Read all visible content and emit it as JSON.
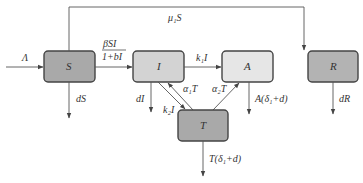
{
  "diagram": {
    "type": "compartmental-model-flowchart",
    "nodes": [
      {
        "id": "S",
        "label": "S",
        "fill": "#a9a9a9"
      },
      {
        "id": "I",
        "label": "I",
        "fill": "#d3d3d3"
      },
      {
        "id": "A",
        "label": "A",
        "fill": "#e6e6e6"
      },
      {
        "id": "R",
        "label": "R",
        "fill": "#b3b3b3"
      },
      {
        "id": "T",
        "label": "T",
        "fill": "#a9a9a9"
      }
    ],
    "edges": [
      {
        "from": "in",
        "to": "S",
        "label": "Λ"
      },
      {
        "from": "S",
        "to": "I",
        "label_num": "βSI",
        "label_den": "1+bI"
      },
      {
        "from": "S",
        "to": "R",
        "label": "μ₁S"
      },
      {
        "from": "I",
        "to": "A",
        "label": "k₁I"
      },
      {
        "from": "I",
        "to": "T",
        "label": "k₂I"
      },
      {
        "from": "T",
        "to": "I",
        "label": "α₁T"
      },
      {
        "from": "T",
        "to": "A",
        "label": "α₂T"
      },
      {
        "from": "S",
        "to": "out",
        "label": "dS"
      },
      {
        "from": "I",
        "to": "out",
        "label": "dI"
      },
      {
        "from": "A",
        "to": "out",
        "label": "A(δ₁+d)"
      },
      {
        "from": "R",
        "to": "out",
        "label": "dR"
      },
      {
        "from": "T",
        "to": "out",
        "label": "T(δ₁+d)"
      }
    ]
  },
  "labels": {
    "lambda": "Λ",
    "beta_num": "βSI",
    "beta_den": "1+bI",
    "mu1S": "μ₁S",
    "k1I": "k₁I",
    "k2I": "k₂I",
    "alpha1T": "α₁T",
    "alpha2T": "α₂T",
    "dS": "dS",
    "dI": "dI",
    "A_out": "A(δ₁+d)",
    "dR": "dR",
    "T_out": "T(δ₁+d)",
    "S": "S",
    "I": "I",
    "A": "A",
    "R": "R",
    "T": "T"
  }
}
